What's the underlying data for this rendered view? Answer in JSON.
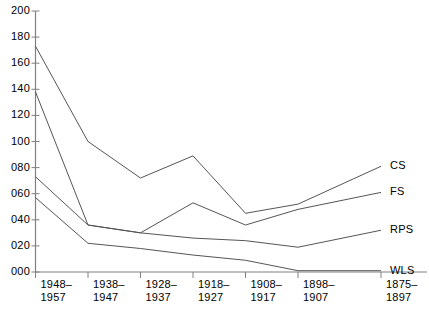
{
  "chart_data": {
    "type": "line",
    "title": "",
    "subtitle": "",
    "xlabel": "",
    "ylabel": "",
    "ylim": [
      0,
      200
    ],
    "ytick_step": 20,
    "grid": false,
    "legend_position": "right-inline-labels",
    "categories": [
      "1948–\n1957",
      "1938–\n1947",
      "1928–\n1937",
      "1918–\n1927",
      "1908–\n1917",
      "1898–\n1907",
      "1875–\n1897"
    ],
    "ytick_labels": [
      "000",
      "020",
      "040",
      "060",
      "080",
      "100",
      "120",
      "140",
      "160",
      "180",
      "200"
    ],
    "ytick_values": [
      0,
      20,
      40,
      60,
      80,
      100,
      120,
      140,
      160,
      180,
      200
    ],
    "series": [
      {
        "name": "CS",
        "values": [
          173,
          100,
          72,
          89,
          45,
          52,
          81
        ]
      },
      {
        "name": "FS",
        "values": [
          138,
          36,
          30,
          53,
          36,
          48,
          61
        ]
      },
      {
        "name": "RPS",
        "values": [
          73,
          36,
          30,
          26,
          24,
          19,
          32
        ]
      },
      {
        "name": "WLS",
        "values": [
          57,
          22,
          18,
          13,
          9,
          1,
          1
        ]
      }
    ],
    "line_color": "#555555",
    "axis_color": "#808080",
    "text_color": "#000000"
  },
  "footnote": {
    "text": ""
  }
}
